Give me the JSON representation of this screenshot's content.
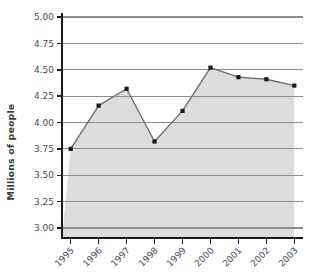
{
  "chart_data": {
    "type": "area",
    "title": "",
    "subtitle": "",
    "xlabel": "",
    "ylabel": "Millions of people",
    "categories": [
      "1995",
      "1996",
      "1997",
      "1998",
      "1999",
      "2000",
      "2001",
      "2002",
      "2003"
    ],
    "values": [
      3.75,
      4.16,
      4.32,
      3.82,
      4.11,
      4.52,
      4.43,
      4.41,
      4.35
    ],
    "series": [
      {
        "name": "Millions of people",
        "values": [
          3.75,
          4.16,
          4.32,
          3.82,
          4.11,
          4.52,
          4.43,
          4.41,
          4.35
        ]
      }
    ],
    "ylim": [
      3.0,
      5.0
    ],
    "ytick_labels": [
      "5.00",
      "4.75",
      "4.50",
      "4.25",
      "4.00",
      "3.75",
      "3.50",
      "3.25",
      "3.00"
    ],
    "ytick_values": [
      5.0,
      4.75,
      4.5,
      4.25,
      4.0,
      3.75,
      3.5,
      3.25,
      3.0
    ],
    "xtick_labels": [
      "1995",
      "1996",
      "1997",
      "1998",
      "1999",
      "2000",
      "2001",
      "2002",
      "2003"
    ],
    "grid": true,
    "grid_axis": "y",
    "legend": false,
    "legend_position": "none",
    "marker": "square",
    "xtick_label_rotation": -45,
    "colors": {
      "fill": "#dcdcdc",
      "line": "#6e6e6e",
      "marker": "#1a1a1a",
      "gridline": "#8c8c8c",
      "axis": "#1a1a1a",
      "text": "#4a4a4a",
      "background": "#ffffff"
    }
  },
  "axis_titles": {
    "y": "Millions of people"
  }
}
